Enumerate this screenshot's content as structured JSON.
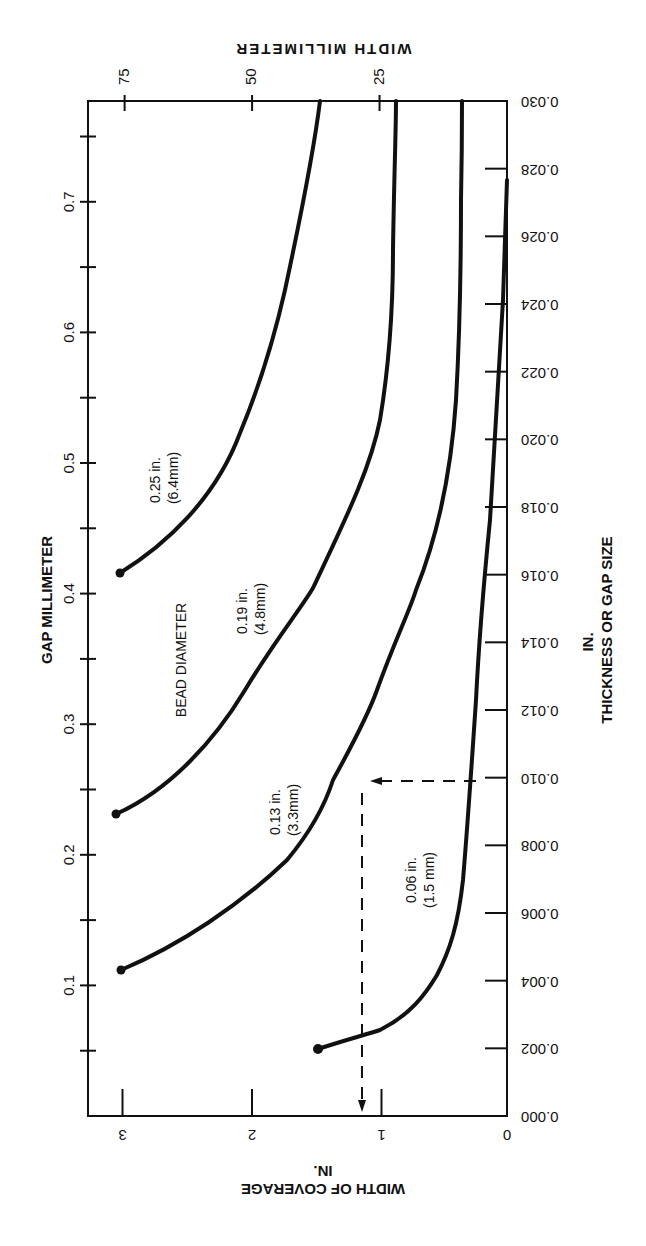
{
  "chart_data": {
    "type": "line",
    "title": "",
    "orientation_note_visible": "rotated 90 degrees",
    "x_axis_primary": {
      "label": "WIDTH OF COVERAGE",
      "unit_label": "IN.",
      "ticks": [
        "0",
        "1",
        "2",
        "3"
      ],
      "range": [
        0,
        3.3
      ]
    },
    "x_axis_secondary": {
      "label": "WIDTH MILLIMETER",
      "ticks": [
        "25",
        "50",
        "75"
      ]
    },
    "y_axis_primary": {
      "label": "THICKNESS OR GAP SIZE",
      "unit_label": "IN.",
      "ticks": [
        "0.000",
        "0.002",
        "0.004",
        "0.006",
        "0.008",
        "0.010",
        "0.012",
        "0.014",
        "0.016",
        "0.018",
        "0.020",
        "0.022",
        "0.024",
        "0.026",
        "0.028",
        "0.030"
      ],
      "range": [
        0,
        0.03
      ]
    },
    "y_axis_secondary": {
      "label": "GAP MILLIMETER",
      "ticks": [
        "0.1",
        "0.2",
        "0.3",
        "0.4",
        "0.5",
        "0.6",
        "0.7"
      ]
    },
    "legend_title": "BEAD DIAMETER",
    "series": [
      {
        "name": "0.25 in. (6.4mm)",
        "label_line1": "0.25 in.",
        "label_line2": "(6.4mm)",
        "points_width_in_vs_gap_in": [
          [
            3.0,
            0.016
          ],
          [
            2.6,
            0.0185
          ],
          [
            2.2,
            0.0203
          ],
          [
            1.8,
            0.0226
          ],
          [
            1.6,
            0.024
          ],
          [
            1.45,
            0.0265
          ],
          [
            1.4,
            0.03
          ]
        ]
      },
      {
        "name": "0.19 in. (4.8mm)",
        "label_line1": "0.19 in.",
        "label_line2": "(4.8mm)",
        "points_width_in_vs_gap_in": [
          [
            3.0,
            0.0089
          ],
          [
            2.5,
            0.0126
          ],
          [
            2.0,
            0.0155
          ],
          [
            1.5,
            0.018
          ],
          [
            1.0,
            0.022
          ],
          [
            0.9,
            0.026
          ],
          [
            0.85,
            0.03
          ]
        ]
      },
      {
        "name": "0.13 in. (3.3mm)",
        "label_line1": "0.13 in.",
        "label_line2": "(3.3mm)",
        "points_width_in_vs_gap_in": [
          [
            3.0,
            0.0043
          ],
          [
            2.5,
            0.0066
          ],
          [
            2.0,
            0.0083
          ],
          [
            1.5,
            0.0108
          ],
          [
            1.0,
            0.0155
          ],
          [
            0.7,
            0.0196
          ],
          [
            0.5,
            0.025
          ],
          [
            0.35,
            0.03
          ]
        ]
      },
      {
        "name": "0.06 in. (1.5 mm)",
        "label_line1": "0.06 in.",
        "label_line2": "(1.5 mm)",
        "points_width_in_vs_gap_in": [
          [
            1.5,
            0.002
          ],
          [
            1.0,
            0.0026
          ],
          [
            0.6,
            0.004
          ],
          [
            0.4,
            0.0055
          ],
          [
            0.28,
            0.008
          ],
          [
            0.2,
            0.014
          ],
          [
            0.1,
            0.02
          ],
          [
            0.0,
            0.0275
          ]
        ]
      }
    ],
    "annotation": {
      "type": "dashed-arrow",
      "gap_in": 0.01,
      "width_in": 1.15,
      "description": "Example reading: 0.010 in. gap with 0.06 in. bead gives about 1.15 in. width of coverage"
    },
    "grid": false
  }
}
